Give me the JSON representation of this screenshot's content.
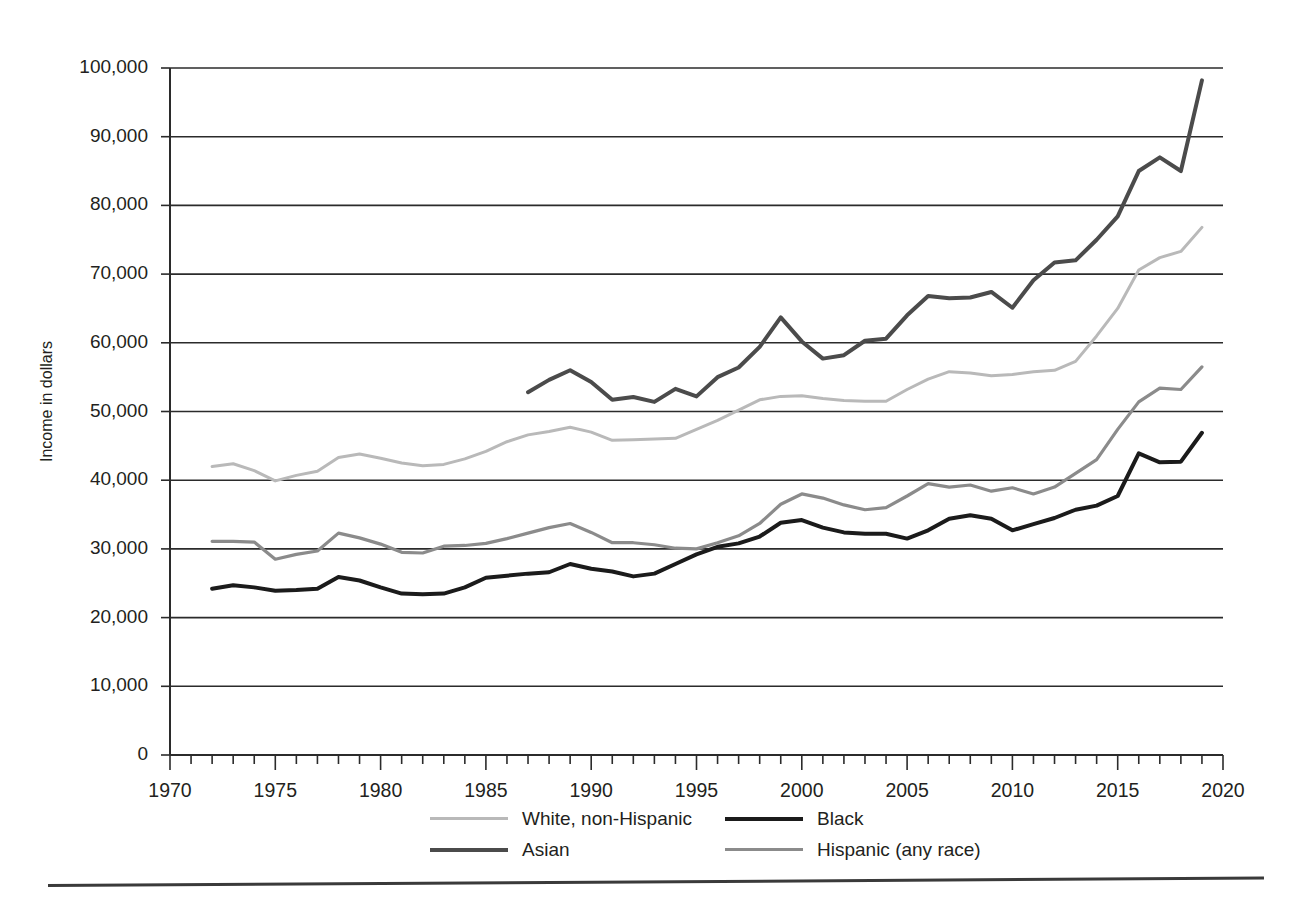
{
  "chart_data": {
    "type": "line",
    "title": "",
    "xlabel": "",
    "ylabel": "Income in dollars",
    "xlim": [
      1970,
      2020
    ],
    "ylim": [
      0,
      100000
    ],
    "grid": "horizontal",
    "legend_position": "bottom",
    "x_ticks_major": [
      1970,
      1975,
      1980,
      1985,
      1990,
      1995,
      2000,
      2005,
      2010,
      2015,
      2020
    ],
    "x_ticks_minor_step": 1,
    "y_ticks": [
      0,
      10000,
      20000,
      30000,
      40000,
      50000,
      60000,
      70000,
      80000,
      90000,
      100000
    ],
    "y_tick_labels": [
      "0",
      "10,000",
      "20,000",
      "30,000",
      "40,000",
      "50,000",
      "60,000",
      "70,000",
      "80,000",
      "90,000",
      "100,000"
    ],
    "x_tick_labels": [
      "1970",
      "1975",
      "1980",
      "1985",
      "1990",
      "1995",
      "2000",
      "2005",
      "2010",
      "2015",
      "2020"
    ],
    "series": [
      {
        "name": "White, non-Hispanic",
        "color": "#b9b9b9",
        "width": 3.0,
        "x": [
          1972,
          1973,
          1974,
          1975,
          1976,
          1977,
          1978,
          1979,
          1980,
          1981,
          1982,
          1983,
          1984,
          1985,
          1986,
          1987,
          1988,
          1989,
          1990,
          1991,
          1992,
          1993,
          1994,
          1995,
          1996,
          1997,
          1998,
          1999,
          2000,
          2001,
          2002,
          2003,
          2004,
          2005,
          2006,
          2007,
          2008,
          2009,
          2010,
          2011,
          2012,
          2013,
          2014,
          2015,
          2016,
          2017,
          2018,
          2019
        ],
        "values": [
          42000,
          42400,
          41400,
          39900,
          40700,
          41300,
          43300,
          43800,
          43200,
          42500,
          42100,
          42300,
          43100,
          44200,
          45600,
          46600,
          47100,
          47700,
          47000,
          45800,
          45900,
          46000,
          46100,
          47400,
          48700,
          50200,
          51700,
          52200,
          52300,
          51900,
          51600,
          51500,
          51500,
          53200,
          54700,
          55800,
          55600,
          55200,
          55400,
          55800,
          56000,
          57300,
          61000,
          65000,
          70600,
          72400,
          73300,
          76800
        ]
      },
      {
        "name": "Black",
        "color": "#1b1b1b",
        "width": 4.0,
        "x": [
          1972,
          1973,
          1974,
          1975,
          1976,
          1977,
          1978,
          1979,
          1980,
          1981,
          1982,
          1983,
          1984,
          1985,
          1986,
          1987,
          1988,
          1989,
          1990,
          1991,
          1992,
          1993,
          1994,
          1995,
          1996,
          1997,
          1998,
          1999,
          2000,
          2001,
          2002,
          2003,
          2004,
          2005,
          2006,
          2007,
          2008,
          2009,
          2010,
          2011,
          2012,
          2013,
          2014,
          2015,
          2016,
          2017,
          2018,
          2019
        ],
        "values": [
          24200,
          24700,
          24400,
          23900,
          24000,
          24200,
          25900,
          25400,
          24400,
          23500,
          23400,
          23500,
          24400,
          25800,
          26100,
          26400,
          26600,
          27800,
          27100,
          26700,
          26000,
          26400,
          27800,
          29200,
          30300,
          30800,
          31800,
          33800,
          34200,
          33100,
          32400,
          32200,
          32200,
          31500,
          32700,
          34400,
          34900,
          34400,
          32700,
          33600,
          34500,
          35700,
          36300,
          37700,
          43900,
          42600,
          42700,
          46900
        ]
      },
      {
        "name": "Asian",
        "color": "#4b4b4b",
        "width": 4.0,
        "x": [
          1987,
          1988,
          1989,
          1990,
          1991,
          1992,
          1993,
          1994,
          1995,
          1996,
          1997,
          1998,
          1999,
          2000,
          2001,
          2002,
          2003,
          2004,
          2005,
          2006,
          2007,
          2008,
          2009,
          2010,
          2011,
          2012,
          2013,
          2014,
          2015,
          2016,
          2017,
          2018,
          2019
        ],
        "values": [
          52800,
          54600,
          56000,
          54300,
          51700,
          52100,
          51400,
          53300,
          52200,
          55000,
          56400,
          59400,
          63700,
          60200,
          57700,
          58200,
          60300,
          60600,
          64000,
          66800,
          66500,
          66600,
          67400,
          65100,
          69100,
          71700,
          72000,
          75000,
          78400,
          85000,
          87000,
          85000,
          98200
        ]
      },
      {
        "name": "Hispanic (any race)",
        "color": "#8b8b8b",
        "width": 3.2,
        "x": [
          1972,
          1973,
          1974,
          1975,
          1976,
          1977,
          1978,
          1979,
          1980,
          1981,
          1982,
          1983,
          1984,
          1985,
          1986,
          1987,
          1988,
          1989,
          1990,
          1991,
          1992,
          1993,
          1994,
          1995,
          1996,
          1997,
          1998,
          1999,
          2000,
          2001,
          2002,
          2003,
          2004,
          2005,
          2006,
          2007,
          2008,
          2009,
          2010,
          2011,
          2012,
          2013,
          2014,
          2015,
          2016,
          2017,
          2018,
          2019
        ],
        "values": [
          31100,
          31100,
          31000,
          28500,
          29200,
          29700,
          32300,
          31600,
          30700,
          29500,
          29400,
          30400,
          30500,
          30800,
          31500,
          32300,
          33100,
          33700,
          32400,
          30900,
          30900,
          30600,
          30100,
          30000,
          30900,
          31900,
          33700,
          36500,
          38000,
          37400,
          36400,
          35700,
          36000,
          37700,
          39500,
          39000,
          39300,
          38400,
          38900,
          38000,
          39000,
          41000,
          43000,
          47400,
          51400,
          53400,
          53200,
          56500
        ]
      }
    ]
  },
  "legend": {
    "entries": [
      {
        "label": "White, non-Hispanic",
        "color": "#b9b9b9",
        "width": "3px"
      },
      {
        "label": "Black",
        "color": "#1b1b1b",
        "width": "4px"
      },
      {
        "label": "Asian",
        "color": "#4b4b4b",
        "width": "4px"
      },
      {
        "label": "Hispanic (any race)",
        "color": "#8b8b8b",
        "width": "3px"
      }
    ]
  }
}
